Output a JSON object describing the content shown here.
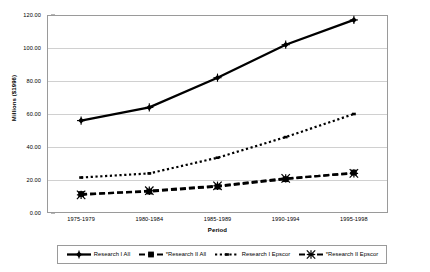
{
  "chart_data": {
    "type": "line",
    "title": "",
    "xlabel": "Period",
    "ylabel": "Millions ($1996)",
    "categories": [
      "1975-1979",
      "1980-1984",
      "1985-1989",
      "1990-1994",
      "1995-1998"
    ],
    "ylim": [
      0,
      120
    ],
    "ytick_labels": [
      "0.00",
      "20.00",
      "40.00",
      "60.00",
      "80.00",
      "100.00",
      "120.00"
    ],
    "ytick_values": [
      0,
      20,
      40,
      60,
      80,
      100,
      120
    ],
    "grid": true,
    "legend_position": "bottom",
    "series": [
      {
        "name": "Research I All",
        "marker": "diamond",
        "line_style": "solid",
        "color": "#000000",
        "values": [
          56.0,
          64.0,
          82.0,
          102.0,
          117.0
        ]
      },
      {
        "name": "*Research II All",
        "marker": "square",
        "line_style": "dashed",
        "color": "#000000",
        "values": [
          11.5,
          13.0,
          16.0,
          20.5,
          24.5
        ]
      },
      {
        "name": "Research I Epscor",
        "marker": "dot",
        "line_style": "dotted",
        "color": "#000000",
        "values": [
          21.5,
          24.0,
          33.5,
          46.0,
          60.0
        ]
      },
      {
        "name": "*Research II Epscor",
        "marker": "star",
        "line_style": "dashed",
        "color": "#000000",
        "values": [
          11.0,
          13.5,
          16.5,
          21.0,
          24.0
        ]
      }
    ]
  },
  "legend": {
    "items": [
      {
        "label": "Research I All"
      },
      {
        "label": "*Research II All"
      },
      {
        "label": "Research I Epscor"
      },
      {
        "label": "*Research II Epscor"
      }
    ]
  }
}
